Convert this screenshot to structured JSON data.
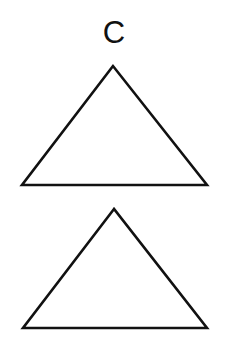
{
  "figure": {
    "label": "C",
    "shapes": [
      {
        "type": "triangle",
        "name": "upper-triangle",
        "points": [
          [
            113,
            66
          ],
          [
            22,
            185
          ],
          [
            207,
            185
          ]
        ]
      },
      {
        "type": "triangle",
        "name": "lower-triangle",
        "points": [
          [
            114,
            209
          ],
          [
            23,
            328
          ],
          [
            207,
            328
          ]
        ]
      }
    ],
    "stroke_color": "#111111",
    "background": "#ffffff"
  }
}
